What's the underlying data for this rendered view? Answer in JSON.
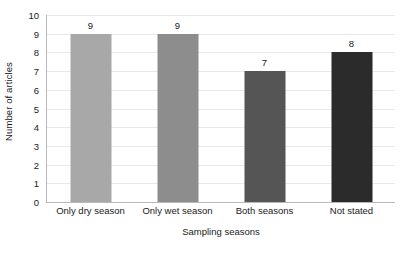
{
  "chart_data": {
    "type": "bar",
    "title": "",
    "subtitle": "",
    "xlabel": "Sampling seasons",
    "ylabel": "Number of articles",
    "categories": [
      "Only dry season",
      "Only wet season",
      "Both seasons",
      "Not stated"
    ],
    "values": [
      9,
      9,
      7,
      8
    ],
    "value_labels": [
      "9",
      "9",
      "7",
      "8"
    ],
    "bar_colors": [
      "#a8a8a8",
      "#8d8d8d",
      "#555555",
      "#2b2b2b"
    ],
    "ylim": [
      0,
      10
    ],
    "ytick_labels": [
      "0",
      "1",
      "2",
      "3",
      "4",
      "5",
      "6",
      "7",
      "8",
      "9",
      "10"
    ],
    "ytick_values": [
      0,
      1,
      2,
      3,
      4,
      5,
      6,
      7,
      8,
      9,
      10
    ],
    "grid": true,
    "grid_color": "#e9e9ec",
    "axis_color": "#b9b9bd",
    "legend": null,
    "legend_position": "none",
    "background": "#ffffff",
    "text_color": "#1a1a1a"
  }
}
